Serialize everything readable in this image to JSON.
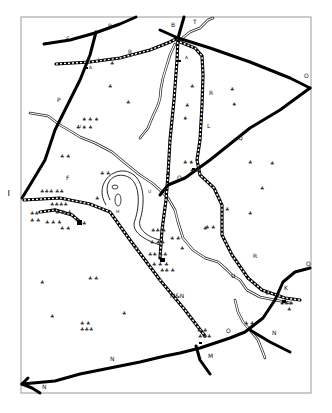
{
  "map": {
    "title": "",
    "frame": {
      "x": 21,
      "y": 18,
      "width": 290,
      "height": 375
    },
    "labels": [
      {
        "id": "S",
        "text": "S",
        "x": 66,
        "y": 41
      },
      {
        "id": "P-top",
        "text": "P",
        "x": 108,
        "y": 28
      },
      {
        "id": "B",
        "text": "B",
        "x": 171,
        "y": 27
      },
      {
        "id": "T",
        "text": "T",
        "x": 193,
        "y": 22
      },
      {
        "id": "K-top",
        "text": "K",
        "x": 87,
        "y": 60
      },
      {
        "id": "L-top",
        "text": "L",
        "x": 98,
        "y": 61
      },
      {
        "id": "R-top",
        "text": "R",
        "x": 128,
        "y": 54
      },
      {
        "id": "A-top",
        "text": "A",
        "x": 89,
        "y": 70
      },
      {
        "id": "A-right",
        "text": "A",
        "x": 185,
        "y": 59
      },
      {
        "id": "O-right",
        "text": "O",
        "x": 306,
        "y": 78
      },
      {
        "id": "R-mid",
        "text": "R",
        "x": 209,
        "y": 95
      },
      {
        "id": "P-left",
        "text": "P",
        "x": 57,
        "y": 102
      },
      {
        "id": "L-mid",
        "text": "L",
        "x": 207,
        "y": 128
      },
      {
        "id": "Q-right",
        "text": "Q",
        "x": 238,
        "y": 138
      },
      {
        "id": "U-top",
        "text": "U",
        "x": 78,
        "y": 128
      },
      {
        "id": "F",
        "text": "F",
        "x": 68,
        "y": 180
      },
      {
        "id": "H",
        "text": "H",
        "x": 117,
        "y": 212
      },
      {
        "id": "U-mid",
        "text": "U",
        "x": 148,
        "y": 193
      },
      {
        "id": "Q-mid",
        "text": "Q",
        "x": 178,
        "y": 179
      },
      {
        "id": "R-low",
        "text": "R",
        "x": 253,
        "y": 256
      },
      {
        "id": "U-low",
        "text": "U",
        "x": 232,
        "y": 276
      },
      {
        "id": "O-low-right",
        "text": "O",
        "x": 308,
        "y": 265
      },
      {
        "id": "M&N",
        "text": "M&N",
        "x": 171,
        "y": 296
      },
      {
        "id": "K-low",
        "text": "K",
        "x": 285,
        "y": 290
      },
      {
        "id": "O-low",
        "text": "O",
        "x": 227,
        "y": 333
      },
      {
        "id": "N-right",
        "text": "N",
        "x": 272,
        "y": 334
      },
      {
        "id": "M",
        "text": "M",
        "x": 210,
        "y": 357
      },
      {
        "id": "N-bottom",
        "text": "N",
        "x": 110,
        "y": 360
      },
      {
        "id": "N-corner",
        "text": "N",
        "x": 43,
        "y": 387
      }
    ],
    "legend_symbols": {
      "road": "solid-thick-line",
      "railway": "dashed-double-line",
      "river": "double-thin-line",
      "settlement": "tree-cluster-glyph"
    },
    "colors": {
      "ink": "#000000",
      "paper": "#ffffff",
      "frame": "#999999"
    }
  }
}
